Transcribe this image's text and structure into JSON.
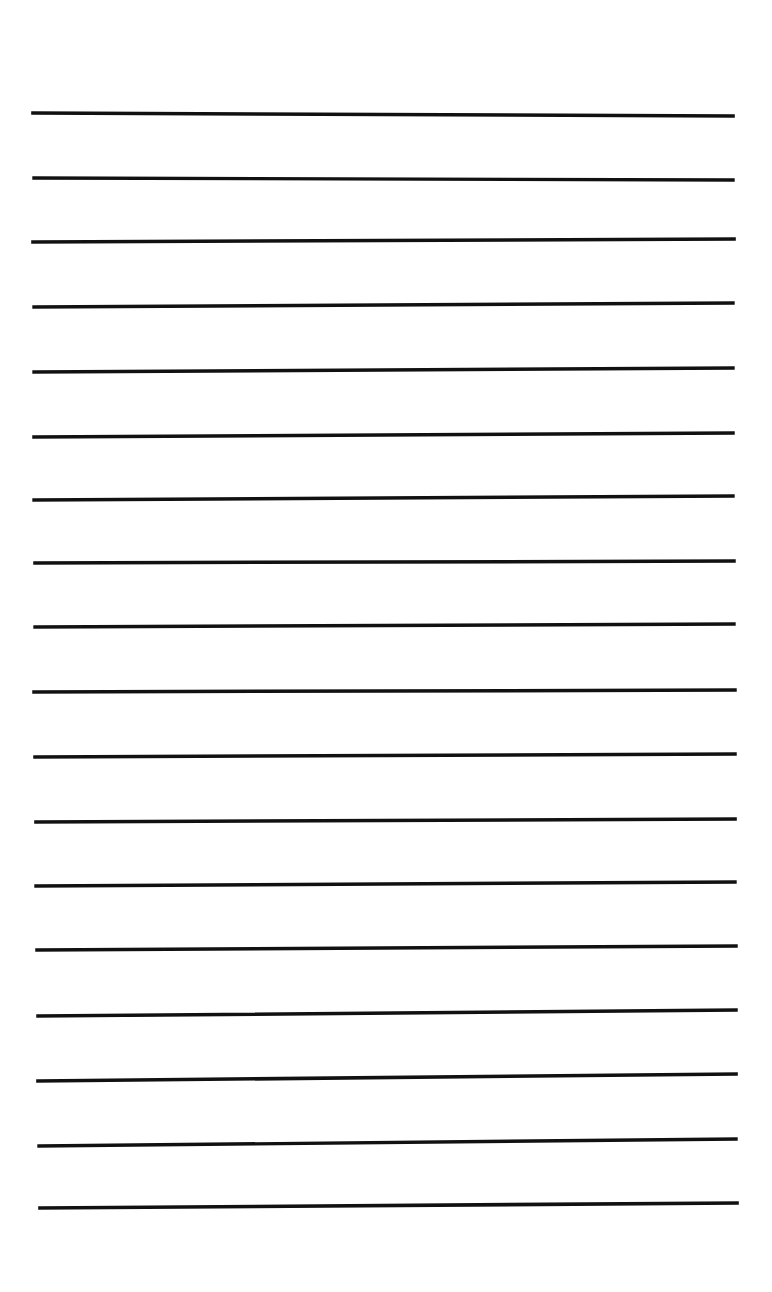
{
  "document": {
    "kind": "scanned-lined-paper",
    "title": "Blank lined notebook page",
    "page_width": 772,
    "page_height": 1292,
    "background_color": "#ffffff",
    "ink_color": "#111111",
    "written_text": "",
    "top_margin": 113,
    "bottom_margin": 84,
    "line_count": 18,
    "average_line_spacing": 64.5,
    "average_stroke_width": 3.5
  },
  "chart_data": {
    "type": "line",
    "xlabel": "",
    "ylabel": "",
    "xlim": [
      0,
      772
    ],
    "ylim": [
      0,
      1292
    ],
    "grid": false,
    "legend": "none",
    "annotations": [],
    "lines": [
      {
        "index": 1,
        "x1": 33,
        "y1": 113,
        "x2": 733,
        "y2": 116,
        "width": 3.6
      },
      {
        "index": 2,
        "x1": 34,
        "y1": 178,
        "x2": 733,
        "y2": 180,
        "width": 3.4
      },
      {
        "index": 3,
        "x1": 33,
        "y1": 242,
        "x2": 734,
        "y2": 239,
        "width": 3.6
      },
      {
        "index": 4,
        "x1": 34,
        "y1": 307,
        "x2": 733,
        "y2": 303,
        "width": 3.4
      },
      {
        "index": 5,
        "x1": 34,
        "y1": 372,
        "x2": 733,
        "y2": 368,
        "width": 3.4
      },
      {
        "index": 6,
        "x1": 34,
        "y1": 437,
        "x2": 733,
        "y2": 433,
        "width": 3.5
      },
      {
        "index": 7,
        "x1": 34,
        "y1": 500,
        "x2": 733,
        "y2": 496,
        "width": 3.4
      },
      {
        "index": 8,
        "x1": 35,
        "y1": 563,
        "x2": 734,
        "y2": 561,
        "width": 3.5
      },
      {
        "index": 9,
        "x1": 35,
        "y1": 627,
        "x2": 734,
        "y2": 624,
        "width": 3.4
      },
      {
        "index": 10,
        "x1": 34,
        "y1": 692,
        "x2": 735,
        "y2": 690,
        "width": 3.5
      },
      {
        "index": 11,
        "x1": 35,
        "y1": 757,
        "x2": 735,
        "y2": 754,
        "width": 3.5
      },
      {
        "index": 12,
        "x1": 36,
        "y1": 822,
        "x2": 735,
        "y2": 819,
        "width": 3.6
      },
      {
        "index": 13,
        "x1": 36,
        "y1": 886,
        "x2": 735,
        "y2": 882,
        "width": 3.4
      },
      {
        "index": 14,
        "x1": 37,
        "y1": 950,
        "x2": 736,
        "y2": 946,
        "width": 3.5
      },
      {
        "index": 15,
        "x1": 38,
        "y1": 1016,
        "x2": 736,
        "y2": 1010,
        "width": 3.5
      },
      {
        "index": 16,
        "x1": 38,
        "y1": 1081,
        "x2": 736,
        "y2": 1074,
        "width": 3.6
      },
      {
        "index": 17,
        "x1": 39,
        "y1": 1146,
        "x2": 736,
        "y2": 1139,
        "width": 3.4
      },
      {
        "index": 18,
        "x1": 40,
        "y1": 1208,
        "x2": 737,
        "y2": 1203,
        "width": 3.6
      }
    ]
  }
}
